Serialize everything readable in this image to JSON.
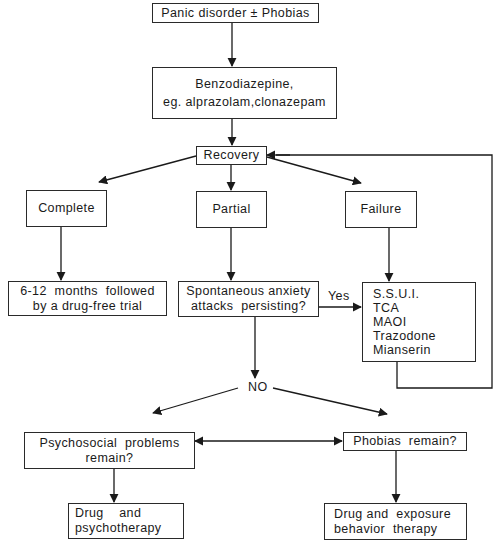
{
  "diagram": {
    "type": "treatment-flowchart",
    "nodes": {
      "start": {
        "label": "Panic disorder ± Phobias"
      },
      "benzo": {
        "lines": [
          "Benzodiazepine,",
          "eg.  alprazolam,clonazepam"
        ]
      },
      "recovery": {
        "label": "Recovery"
      },
      "complete": {
        "label": "Complete"
      },
      "partial": {
        "label": "Partial"
      },
      "failure": {
        "label": "Failure"
      },
      "maintenance": {
        "lines": [
          "6-12  months  followed",
          "by a drug-free trial"
        ]
      },
      "spontaneous": {
        "lines": [
          "Spontaneous anxiety",
          "attacks  persisting?"
        ]
      },
      "alternatives": {
        "lines": [
          "S.S.U.I.",
          "TCA",
          "MAOI",
          "Trazodone",
          "Mianserin"
        ]
      },
      "psychosocial": {
        "lines": [
          "Psychosocial  problems",
          "remain?"
        ]
      },
      "phobias": {
        "label": "Phobias  remain?"
      },
      "drug_psycho": {
        "lines": [
          "Drug    and",
          "psychotherapy"
        ]
      },
      "drug_exposure": {
        "lines": [
          "Drug and  exposure",
          "behavior  therapy"
        ]
      }
    },
    "edge_labels": {
      "yes": "Yes",
      "no": "NO"
    },
    "edges": [
      {
        "from": "start",
        "to": "benzo"
      },
      {
        "from": "benzo",
        "to": "recovery"
      },
      {
        "from": "recovery",
        "to": "complete"
      },
      {
        "from": "recovery",
        "to": "partial"
      },
      {
        "from": "recovery",
        "to": "failure"
      },
      {
        "from": "complete",
        "to": "maintenance"
      },
      {
        "from": "partial",
        "to": "spontaneous"
      },
      {
        "from": "failure",
        "to": "alternatives"
      },
      {
        "from": "spontaneous",
        "to": "alternatives",
        "label": "Yes"
      },
      {
        "from": "alternatives",
        "to": "recovery",
        "type": "feedback-loop"
      },
      {
        "from": "spontaneous",
        "to": "psychosocial",
        "label": "NO"
      },
      {
        "from": "spontaneous",
        "to": "phobias",
        "label": "NO"
      },
      {
        "from": "psychosocial",
        "to": "phobias",
        "type": "bidirectional"
      },
      {
        "from": "psychosocial",
        "to": "drug_psycho"
      },
      {
        "from": "phobias",
        "to": "drug_exposure"
      }
    ],
    "line_color": "#1a1a1a"
  }
}
